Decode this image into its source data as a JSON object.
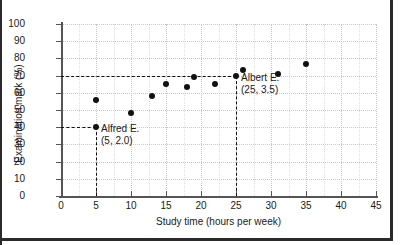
{
  "chart_data": {
    "type": "scatter",
    "title": "",
    "xlabel": "Study time (hours per week)",
    "ylabel": "Examination mark (%)",
    "xlim": [
      0,
      45
    ],
    "ylim": [
      0,
      100
    ],
    "xticks": [
      "0",
      "5",
      "10",
      "15",
      "20",
      "25",
      "30",
      "35",
      "40",
      "45"
    ],
    "xtick_values": [
      0,
      5,
      10,
      15,
      20,
      25,
      30,
      35,
      40,
      45
    ],
    "yticks": [
      "0",
      "10",
      "20",
      "30",
      "40",
      "50",
      "60",
      "70",
      "80",
      "90",
      "100"
    ],
    "ytick_values": [
      0,
      10,
      20,
      30,
      40,
      50,
      60,
      70,
      80,
      90,
      100
    ],
    "grid": true,
    "legend": null,
    "marker_color": "#111111",
    "points": [
      {
        "x": 5,
        "y": 40
      },
      {
        "x": 5,
        "y": 56
      },
      {
        "x": 10,
        "y": 48
      },
      {
        "x": 13,
        "y": 58
      },
      {
        "x": 15,
        "y": 65
      },
      {
        "x": 18,
        "y": 63.5
      },
      {
        "x": 19,
        "y": 69
      },
      {
        "x": 22,
        "y": 65
      },
      {
        "x": 25,
        "y": 69.5
      },
      {
        "x": 26,
        "y": 73
      },
      {
        "x": 31,
        "y": 71
      },
      {
        "x": 35,
        "y": 76.5
      }
    ],
    "guide_lines": [
      {
        "orientation": "horizontal",
        "value": 40,
        "from_x": 0,
        "to_x": 5,
        "style": "dashed"
      },
      {
        "orientation": "vertical",
        "value": 5,
        "from_y": 0,
        "to_y": 40,
        "style": "dashed"
      },
      {
        "orientation": "horizontal",
        "value": 70,
        "from_x": 0,
        "to_x": 25,
        "style": "dashed"
      },
      {
        "orientation": "vertical",
        "value": 25,
        "from_y": 0,
        "to_y": 70,
        "style": "dashed"
      }
    ],
    "annotations": [
      {
        "name": "Alfred E.",
        "coords": "(5, 2.0)",
        "at_x": 5,
        "at_y": 40
      },
      {
        "name": "Albert E.",
        "coords": "(25, 3.5)",
        "at_x": 25,
        "at_y": 70
      }
    ]
  }
}
